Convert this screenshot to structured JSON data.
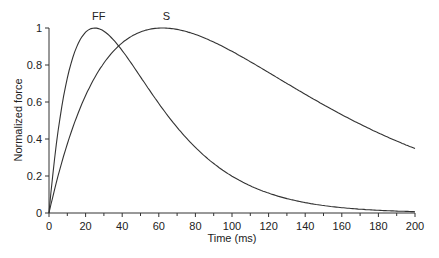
{
  "chart_data": {
    "type": "line",
    "title": "",
    "xlabel": "Time (ms)",
    "ylabel": "Normalized force",
    "xlim": [
      0,
      200
    ],
    "ylim": [
      0,
      1
    ],
    "x_ticks": [
      "0",
      "20",
      "40",
      "60",
      "80",
      "100",
      "120",
      "140",
      "160",
      "180",
      "200"
    ],
    "y_ticks": [
      "0",
      "0.2",
      "0.4",
      "0.6",
      "0.8",
      "1"
    ],
    "grid": false,
    "legend": "inline labels above peaks",
    "series": [
      {
        "name": "FF",
        "peak_time_ms": 25,
        "x": [
          0,
          10,
          20,
          25,
          30,
          40,
          50,
          60,
          80,
          100,
          120,
          140,
          160,
          180,
          200
        ],
        "values": [
          0,
          0.72,
          0.98,
          1.0,
          0.98,
          0.88,
          0.74,
          0.59,
          0.35,
          0.2,
          0.11,
          0.06,
          0.03,
          0.016,
          0.007
        ]
      },
      {
        "name": "S",
        "peak_time_ms": 62,
        "x": [
          0,
          10,
          20,
          40,
          60,
          62,
          80,
          100,
          120,
          140,
          160,
          180,
          200
        ],
        "values": [
          0,
          0.39,
          0.67,
          0.93,
          1.0,
          1.0,
          0.96,
          0.87,
          0.77,
          0.66,
          0.56,
          0.44,
          0.35
        ]
      }
    ]
  }
}
